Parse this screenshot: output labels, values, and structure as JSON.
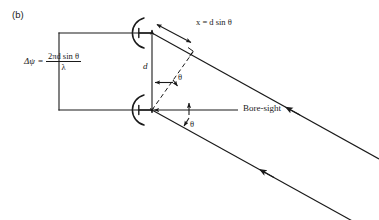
{
  "figure": {
    "panel_label": "(b)",
    "type": "antenna-array-phase-difference-diagram",
    "background_color": "#ffffff",
    "line_color": "#1a1a1a"
  },
  "formula": {
    "lhs": "Δψ",
    "equals": "=",
    "numerator": "2πd sin θ",
    "denominator": "λ",
    "full_text": "Δψ = 2πd sin θ / λ"
  },
  "annotations": {
    "path_difference": "x = d sin θ",
    "spacing": "d",
    "angle_upper": "θ",
    "angle_lower": "θ",
    "boresight": "Bore-sight"
  },
  "elements": {
    "antenna_top_name": "parabolic-antenna-top",
    "antenna_bottom_name": "parabolic-antenna-bottom",
    "ray_top_name": "incoming-ray-top",
    "ray_bottom_name": "incoming-ray-bottom",
    "wavefront_name": "wavefront-line",
    "right_angle_marker": "right-angle-marker"
  }
}
